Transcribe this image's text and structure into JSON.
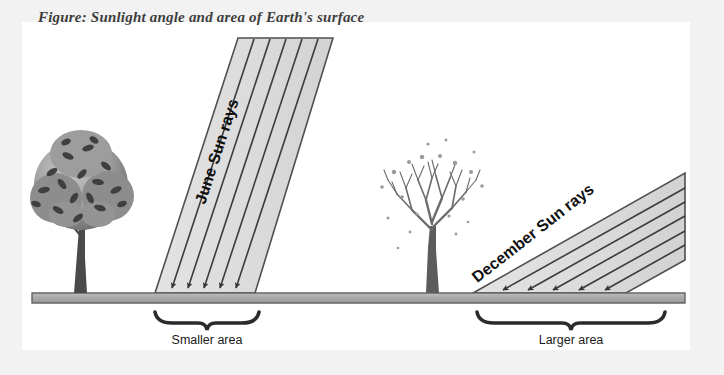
{
  "page": {
    "background_color": "#f2f2f2",
    "figure_background_color": "#ffffff",
    "clipped_top_text": "Figure: Sunlight angle and area of Earth's surface"
  },
  "diagram": {
    "type": "illustration",
    "ground": {
      "label": "ground-surface",
      "fill_color": "#a8a8a8",
      "edge_color": "#5a5a5a"
    },
    "panels": [
      {
        "id": "june",
        "season_label": "June Sun rays",
        "area_label": "Smaller area",
        "tree_type": "leafy-summer-tree",
        "beam_angle_degrees": 72,
        "ray_count": 5,
        "beam_fill_color": "#dcdcdc",
        "beam_edge_color": "#4a4a4a"
      },
      {
        "id": "december",
        "season_label": "December Sun rays",
        "area_label": "Larger area",
        "tree_type": "bare-winter-tree",
        "beam_angle_degrees": 38,
        "ray_count": 5,
        "beam_fill_color": "#dcdcdc",
        "beam_edge_color": "#4a4a4a"
      }
    ]
  }
}
